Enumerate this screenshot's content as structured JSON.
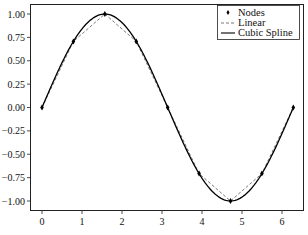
{
  "chart_data": {
    "type": "line",
    "title": "",
    "xlabel": "",
    "ylabel": "",
    "xlim": [
      -0.31,
      6.59
    ],
    "ylim": [
      -1.1,
      1.1
    ],
    "grid": false,
    "legend_position": "upper right",
    "x_ticks": [
      0,
      1,
      2,
      3,
      4,
      5,
      6
    ],
    "x_tick_labels": [
      "0",
      "1",
      "2",
      "3",
      "4",
      "5",
      "6"
    ],
    "y_ticks": [
      1.0,
      0.75,
      0.5,
      0.25,
      0.0,
      -0.25,
      -0.5,
      -0.75,
      -1.0
    ],
    "y_tick_labels": [
      "1.00",
      "0.75",
      "0.50",
      "0.25",
      "0.00",
      "-0.25",
      "-0.50",
      "-0.75",
      "-1.00"
    ],
    "nodes": {
      "x": [
        0.0,
        0.785,
        1.571,
        2.356,
        3.142,
        3.927,
        4.712,
        5.498,
        6.283
      ],
      "y": [
        0.0,
        0.707,
        1.0,
        0.707,
        0.0,
        -0.707,
        -1.0,
        -0.707,
        0.0
      ]
    },
    "series": [
      {
        "name": "Nodes",
        "style": "markers",
        "marker": "diamond",
        "color": "#000000"
      },
      {
        "name": "Linear",
        "style": "dashed",
        "color": "#555555"
      },
      {
        "name": "Cubic Spline",
        "style": "solid",
        "color": "#000000"
      }
    ]
  }
}
